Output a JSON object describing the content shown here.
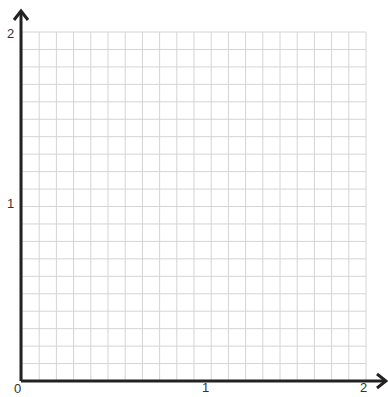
{
  "grid": {
    "columns": 20,
    "rows": 20,
    "line_color": "#d4d4d4",
    "axis_color": "#222222"
  },
  "x_axis": {
    "ticks": [
      {
        "label": "0"
      },
      {
        "label": "1"
      },
      {
        "label": "2"
      }
    ]
  },
  "y_axis": {
    "ticks": [
      {
        "label": "1"
      },
      {
        "label": "2"
      }
    ]
  }
}
